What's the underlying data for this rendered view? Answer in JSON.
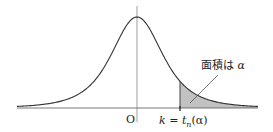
{
  "diagram": {
    "origin_label": "O",
    "k_label": "k",
    "equals": " = ",
    "t_symbol": "t",
    "t_subscript": "n",
    "alpha_arg": "(α)",
    "area_label_jp": "面積は",
    "area_label_symbol": "α",
    "colors": {
      "curve": "#333333",
      "axis": "#555555",
      "shade": "#bdbdbd"
    }
  }
}
